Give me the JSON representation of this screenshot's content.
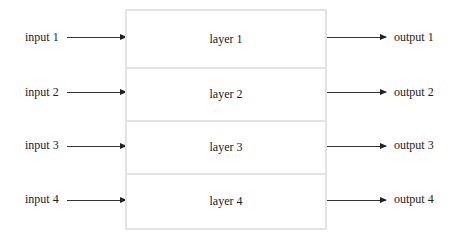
{
  "diagram": {
    "inputs": [
      {
        "label": "input 1"
      },
      {
        "label": "input 2"
      },
      {
        "label": "input 3"
      },
      {
        "label": "input 4"
      }
    ],
    "layers": [
      {
        "label": "layer 1"
      },
      {
        "label": "layer 2"
      },
      {
        "label": "layer 3"
      },
      {
        "label": "layer 4"
      }
    ],
    "outputs": [
      {
        "label": "output 1"
      },
      {
        "label": "output 2"
      },
      {
        "label": "output 3"
      },
      {
        "label": "output 4"
      }
    ],
    "colors": {
      "box_border": "#e3e3e3",
      "arrow": "#222222",
      "text": "#222222"
    }
  }
}
